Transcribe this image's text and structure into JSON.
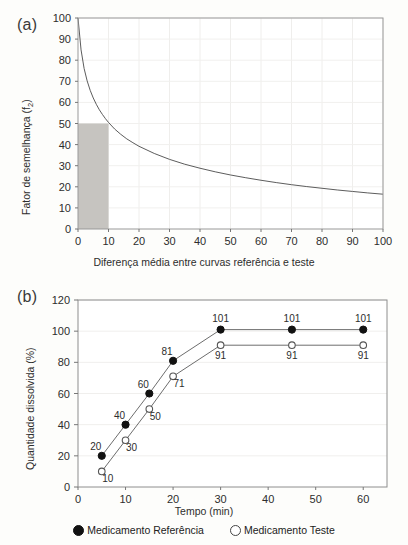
{
  "figure": {
    "panels": [
      {
        "tag": "(a)"
      },
      {
        "tag": "(b)"
      }
    ]
  },
  "panel_a": {
    "tag": "(a)",
    "xlabel": "Diferença média entre curvas referência e teste",
    "ylabel_main": "Fator de semelhança (f",
    "ylabel_sub": "2",
    "ylabel_close": ")",
    "ylabel_full": "Fator de semelhança (f2)",
    "xticks": [
      "0",
      "10",
      "20",
      "30",
      "40",
      "50",
      "60",
      "70",
      "80",
      "90",
      "100"
    ],
    "yticks": [
      "0",
      "10",
      "20",
      "30",
      "40",
      "50",
      "60",
      "70",
      "80",
      "90",
      "100"
    ],
    "shade_color": "#c6c4c0",
    "curve_color": "#4a4a4a"
  },
  "panel_b": {
    "tag": "(b)",
    "xlabel": "Tempo (min)",
    "ylabel": "Quantidade dissolvida (%)",
    "xticks": [
      "0",
      "10",
      "20",
      "30",
      "40",
      "50",
      "60"
    ],
    "yticks": [
      "0",
      "20",
      "40",
      "60",
      "80",
      "100",
      "120"
    ],
    "legend": [
      {
        "marker": "filled-circle",
        "label": "Medicamento Referência"
      },
      {
        "marker": "open-circle",
        "label": "Medicamento Teste"
      }
    ]
  },
  "chart_data": [
    {
      "type": "line",
      "panel": "(a)",
      "title": "",
      "xlabel": "Diferença média entre curvas referência e teste",
      "ylabel": "Fator de semelhança (f2)",
      "xlim": [
        0,
        100
      ],
      "ylim": [
        0,
        100
      ],
      "xticks": [
        0,
        10,
        20,
        30,
        40,
        50,
        60,
        70,
        80,
        90,
        100
      ],
      "yticks": [
        0,
        10,
        20,
        30,
        40,
        50,
        60,
        70,
        80,
        90,
        100
      ],
      "grid": true,
      "legend_position": "none",
      "series": [
        {
          "name": "f2 = 50·log(100/√(1+d²))",
          "x": [
            0,
            1,
            2,
            3,
            4,
            5,
            6,
            7,
            8,
            9,
            10,
            12,
            14,
            16,
            18,
            20,
            25,
            30,
            35,
            40,
            45,
            50,
            55,
            60,
            65,
            70,
            75,
            80,
            85,
            90,
            95,
            100
          ],
          "y": [
            100,
            84.9,
            76.1,
            70.2,
            65.7,
            62.1,
            59.1,
            56.5,
            54.3,
            52.3,
            50.5,
            47.4,
            44.9,
            42.7,
            40.9,
            39.2,
            35.8,
            33.0,
            30.7,
            28.8,
            27.1,
            25.6,
            24.3,
            23.1,
            22.0,
            21.0,
            20.1,
            19.3,
            18.5,
            17.8,
            17.1,
            16.5
          ]
        }
      ],
      "annotations": [
        {
          "type": "shaded_rect",
          "description": "região de aprovação",
          "x_range": [
            0,
            10
          ],
          "y_range": [
            0,
            50
          ],
          "color": "#c6c4c0"
        }
      ]
    },
    {
      "type": "line",
      "panel": "(b)",
      "title": "",
      "xlabel": "Tempo (min)",
      "ylabel": "Quantidade dissolvida (%)",
      "xlim": [
        0,
        65
      ],
      "ylim": [
        0,
        120
      ],
      "xticks": [
        0,
        10,
        20,
        30,
        40,
        50,
        60
      ],
      "yticks": [
        0,
        20,
        40,
        60,
        80,
        100,
        120
      ],
      "grid": true,
      "legend_position": "bottom",
      "x": [
        5,
        10,
        15,
        20,
        30,
        45,
        60
      ],
      "series": [
        {
          "name": "Medicamento Referência",
          "marker": "filled-circle",
          "values": [
            20,
            40,
            60,
            81,
            101,
            101,
            101
          ],
          "labels": [
            "20",
            "40",
            "60",
            "81",
            "101",
            "101",
            "101"
          ]
        },
        {
          "name": "Medicamento Teste",
          "marker": "open-circle",
          "values": [
            10,
            30,
            50,
            71,
            91,
            91,
            91
          ],
          "labels": [
            "10",
            "30",
            "50",
            "71",
            "91",
            "91",
            "91"
          ]
        }
      ]
    }
  ]
}
